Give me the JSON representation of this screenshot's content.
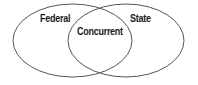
{
  "diagram": {
    "type": "venn",
    "stroke_color": "#555555",
    "background": "#ffffff",
    "sets": [
      {
        "id": "federal",
        "label": "Federal",
        "cx": 72.5,
        "cy": 40.5,
        "rx": 59.5,
        "ry": 36.5
      },
      {
        "id": "state",
        "label": "State",
        "cx": 126,
        "cy": 40.5,
        "rx": 58,
        "ry": 36.5
      }
    ],
    "intersection": {
      "label": "Concurrent"
    }
  }
}
